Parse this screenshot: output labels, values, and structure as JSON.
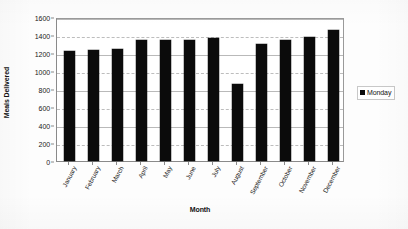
{
  "chart_data": {
    "type": "bar",
    "title": "",
    "xlabel": "Month",
    "ylabel": "Meals Delivered",
    "ylim": [
      0,
      1600
    ],
    "ytick_step": 200,
    "yticks": [
      0,
      200,
      400,
      600,
      800,
      1000,
      1200,
      1400,
      1600
    ],
    "grid": true,
    "legend_position": "right",
    "categories": [
      "January",
      "February",
      "March",
      "April",
      "May",
      "June",
      "July",
      "August",
      "September",
      "October",
      "November",
      "December"
    ],
    "series": [
      {
        "name": "Monday",
        "color": "#0b0b0b",
        "values": [
          1225,
          1235,
          1245,
          1340,
          1350,
          1345,
          1370,
          860,
          1300,
          1350,
          1375,
          1460
        ]
      }
    ]
  },
  "legend": {
    "entries": [
      {
        "label": "Monday",
        "color": "#0b0b0b"
      }
    ]
  },
  "axes": {
    "y_title": "Meals Delivered",
    "x_title": "Month",
    "y_tick_labels": [
      "1600",
      "1400",
      "1200",
      "1000",
      "800",
      "600",
      "400",
      "200",
      "0"
    ],
    "x_tick_labels": [
      "January",
      "February",
      "March",
      "April",
      "May",
      "June",
      "July",
      "August",
      "September",
      "October",
      "November",
      "December"
    ]
  }
}
